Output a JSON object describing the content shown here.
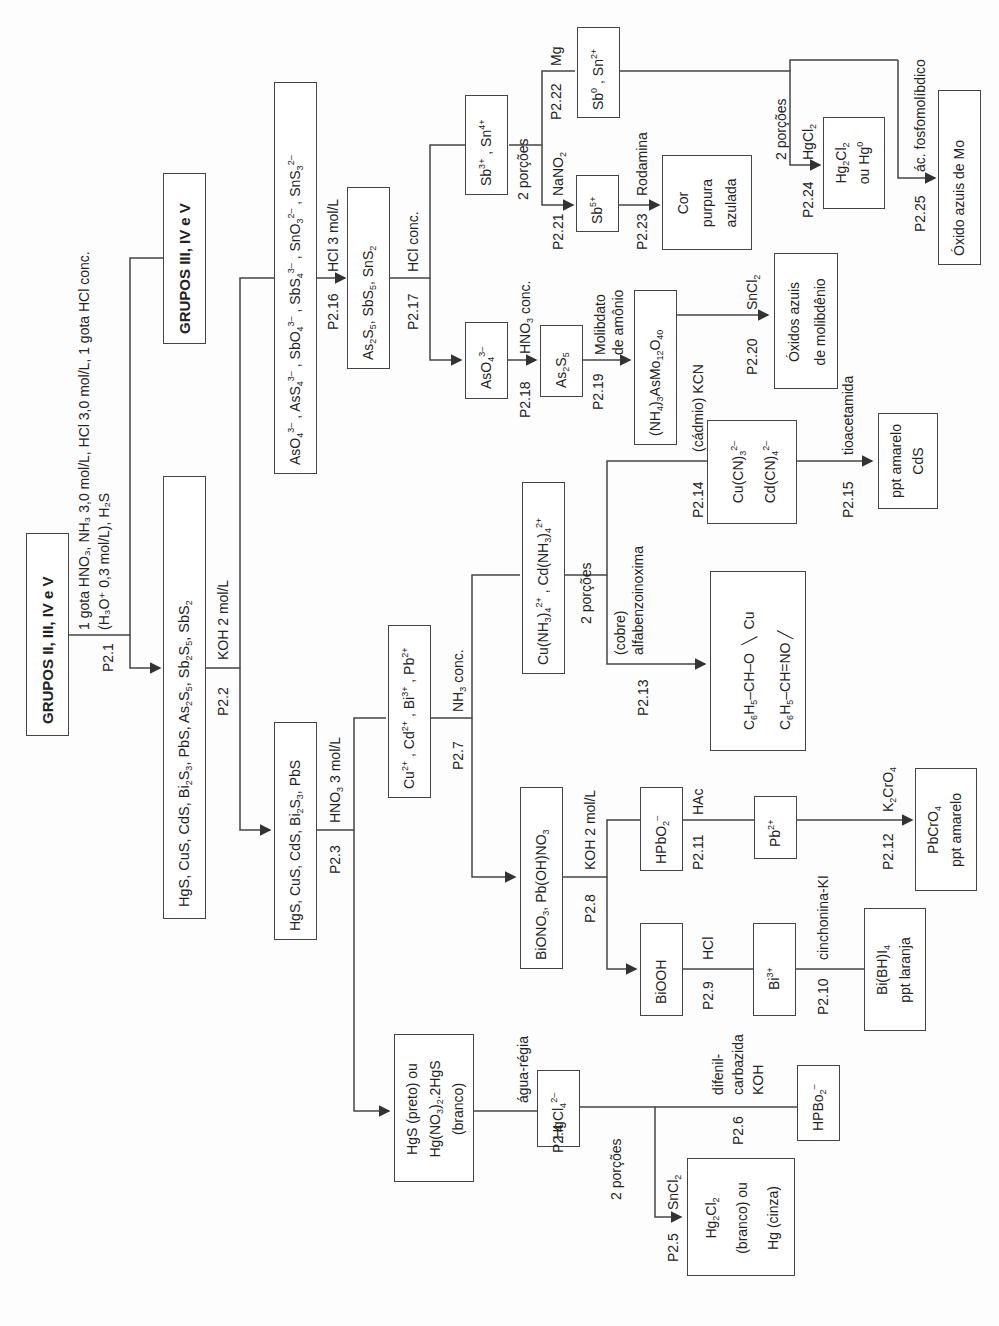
{
  "nodes": {
    "start": "GRUPOS II, III, IV e V",
    "groups_rest": "GRUPOS III, IV e V",
    "sulfides_all": "HgS, CuS, CdS, Bi₂S₃, PbS, As₂S₅, Sb₂S₅, SbS₂",
    "thioanions": "AsO₄³⁻ , AsS₄³⁻ , SbO₄³⁻ , SbS₄³⁻ , SnO₃²⁻ , SnS₃²⁻",
    "sulfides_as_sb_sn": "As₂S₅, SbS₅, SnS₂",
    "sulfides_group2a": "HgS, CuS, CdS, Bi₂S₃, PbS",
    "cations_cu_cd_bi_pb": "Cu²⁺ , Cd²⁺ , Bi³⁺ , Pb²⁺",
    "hgs_residue": [
      "HgS (preto) ou",
      "Hg(NO₃)₂.2HgS",
      "(branco)"
    ],
    "hgcl4": "HgCl₄²⁻",
    "hg2cl2": [
      "Hg₂Cl₂",
      "(branco) ou",
      "Hg (cinza)"
    ],
    "hpbo2_hg": "HPBo₂⁻",
    "bi_pb_hydroxynitrates": "BiONO₃, Pb(OH)NO₃",
    "cu_cd_ammine": "Cu(NH₃)₄²⁺ , Cd(NH₃)₄²⁺",
    "biooh": "BiOOH",
    "bi3": "Bi³⁺",
    "bi_bh_i4": [
      "Bi(BH)I₄",
      "ppt laranja"
    ],
    "hpbo2": "HPbO₂⁻",
    "pb2": "Pb²⁺",
    "pbcro4": [
      "PbCrO₄",
      "ppt amarelo"
    ],
    "cu_complex": [
      "C₆H₅–CH–O",
      "C₆H₅–CH=NO",
      "Cu"
    ],
    "cyanides": [
      "Cu(CN)₃²⁻",
      "Cd(CN)₄²⁻"
    ],
    "cds": [
      "ppt amarelo",
      "CdS"
    ],
    "aso4": "AsO₄³⁻",
    "as2s5": "As₂S₅",
    "arsenomolybdate": "(NH₄)₃AsMo₁₂O₄₀",
    "mo_blue": [
      "Óxidos azuis",
      "de molibdênio"
    ],
    "sb_sn": "Sb³⁺ , Sn⁴⁺",
    "sb5": "Sb⁵⁺",
    "purple": [
      "Cor",
      "purpura",
      "azulada"
    ],
    "sb0_sn2": "Sb⁰ , Sn²⁺",
    "hg2cl2_hg0": [
      "Hg₂Cl₂",
      "ou Hg⁰"
    ],
    "mo_oxide": "Óxido azuis de Mo"
  },
  "steps": {
    "p2_1": {
      "id": "P2.1",
      "reagent": [
        "1 gota HNO₃, NH₃ 3,0 mol/L, HCl 3,0 mol/L, 1 gota HCl conc.",
        "(H₃O⁺ 0,3 mol/L), H₂S"
      ]
    },
    "p2_2": {
      "id": "P2.2",
      "reagent": "KOH 2 mol/L"
    },
    "p2_3": {
      "id": "P2.3",
      "reagent": "HNO₃ 3 mol/L"
    },
    "p2_4": {
      "id": "P2.4",
      "reagent": "água-régia"
    },
    "p2_5": {
      "id": "P2.5",
      "reagent": "SnCl₂"
    },
    "p2_6": {
      "id": "P2.6",
      "reagent": [
        "difenil-",
        "carbazida",
        "KOH"
      ]
    },
    "p2_7": {
      "id": "P2.7",
      "reagent": "NH₃ conc."
    },
    "p2_8": {
      "id": "P2.8",
      "reagent": "KOH 2 mol/L"
    },
    "p2_9": {
      "id": "P2.9",
      "reagent": "HCl"
    },
    "p2_10": {
      "id": "P2.10",
      "reagent": "cinchonina-KI"
    },
    "p2_11": {
      "id": "P2.11",
      "reagent": "HAc"
    },
    "p2_12": {
      "id": "P2.12",
      "reagent": "K₂CrO₄"
    },
    "p2_13": {
      "id": "P2.13",
      "reagent": [
        "(cobre)",
        "alfabenzoinoxima"
      ]
    },
    "p2_14": {
      "id": "P2.14",
      "reagent": "(cádmio) KCN"
    },
    "p2_15": {
      "id": "P2.15",
      "reagent": "tioacetamida"
    },
    "p2_16": {
      "id": "P2.16",
      "reagent": "HCl 3 mol/L"
    },
    "p2_17": {
      "id": "P2.17",
      "reagent": "HCl conc."
    },
    "p2_18": {
      "id": "P2.18",
      "reagent": "HNO₃ conc."
    },
    "p2_19": {
      "id": "P2.19",
      "reagent": [
        "Molibdato",
        "de amônio"
      ]
    },
    "p2_20": {
      "id": "P2.20",
      "reagent": "SnCl₂"
    },
    "p2_21": {
      "id": "P2.21",
      "reagent": "NaNO₂"
    },
    "p2_22": {
      "id": "P2.22",
      "reagent": "Mg"
    },
    "p2_23": {
      "id": "P2.23",
      "reagent": "Rodamina"
    },
    "p2_24": {
      "id": "P2.24",
      "reagent": "HgCl₂"
    },
    "p2_25": {
      "id": "P2.25",
      "reagent": "ác. fosfomolíbdico"
    }
  },
  "split_labels": {
    "hg": "2 porções",
    "cu_cd": "2 porções",
    "sb_sn": "2 porções",
    "sn": "2 porções"
  }
}
